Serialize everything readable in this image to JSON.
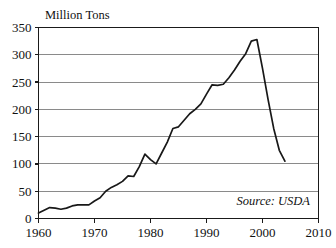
{
  "chart_data": {
    "type": "line",
    "title": "",
    "ylabel": "Million Tons",
    "xlabel": "",
    "ylim": [
      0,
      350
    ],
    "xlim": [
      1960,
      2010
    ],
    "grid": true,
    "legend": false,
    "annotation": "Source: USDA",
    "y_ticks": [
      0,
      50,
      100,
      150,
      200,
      250,
      300,
      350
    ],
    "y_tick_labels": [
      "0",
      "50",
      "100",
      "150",
      "200",
      "250",
      "300",
      "350"
    ],
    "x_ticks": [
      1960,
      1970,
      1980,
      1990,
      2000,
      2010
    ],
    "x_tick_labels": [
      "1960",
      "1970",
      "1980",
      "1990",
      "2000",
      "2010"
    ],
    "series": [
      {
        "name": "Production",
        "x": [
          1960,
          1961,
          1962,
          1963,
          1964,
          1965,
          1966,
          1967,
          1968,
          1969,
          1970,
          1971,
          1972,
          1973,
          1974,
          1975,
          1976,
          1977,
          1978,
          1979,
          1980,
          1981,
          1982,
          1983,
          1984,
          1985,
          1986,
          1987,
          1988,
          1989,
          1990,
          1991,
          1992,
          1993,
          1994,
          1995,
          1996,
          1997,
          1998,
          1999,
          2000,
          2001,
          2002,
          2003,
          2004
        ],
        "values": [
          10,
          15,
          20,
          19,
          17,
          19,
          23,
          25,
          25,
          25,
          32,
          38,
          50,
          57,
          62,
          68,
          78,
          77,
          95,
          118,
          108,
          100,
          120,
          140,
          165,
          168,
          180,
          192,
          200,
          210,
          228,
          245,
          244,
          246,
          258,
          272,
          288,
          302,
          325,
          328,
          275,
          218,
          165,
          125,
          105
        ]
      }
    ]
  },
  "axis_title": "Million Tons",
  "source_note": "Source: USDA"
}
